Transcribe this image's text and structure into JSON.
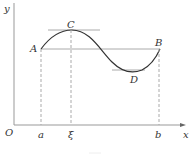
{
  "labels": {
    "y_axis": "y",
    "x_axis": "x",
    "origin": "O",
    "a": "a",
    "xi": "ξ",
    "b": "b",
    "A": "A",
    "B": "B",
    "C": "C",
    "D": "D"
  },
  "colors": {
    "curve": "#333333",
    "tangent": "#999999",
    "axis": "#999999"
  }
}
